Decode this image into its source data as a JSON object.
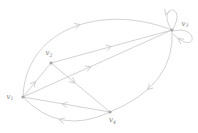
{
  "diagram": {
    "type": "directed-graph",
    "canvas": {
      "width": 198,
      "height": 133,
      "background": "#ffffff"
    },
    "style": {
      "edge_color": "#c7c7c7",
      "node_color": "#a6a6a6",
      "label_color": "#7a7a7a",
      "edge_width": 0.8,
      "node_radius": 1.6,
      "label_font_size": 7,
      "subscript_font_size": 4.6
    },
    "nodes": [
      {
        "id": "v1",
        "label": "v",
        "sub": "1",
        "x": 23,
        "y": 97,
        "label_x": 6.5,
        "label_y": 98.5
      },
      {
        "id": "v2",
        "label": "v",
        "sub": "2",
        "x": 51,
        "y": 63,
        "label_x": 45.5,
        "label_y": 55
      },
      {
        "id": "v3",
        "label": "v",
        "sub": "3",
        "x": 172,
        "y": 30,
        "label_x": 181.5,
        "label_y": 25.5
      },
      {
        "id": "v4",
        "label": "v",
        "sub": "4",
        "x": 110,
        "y": 112,
        "label_x": 109,
        "label_y": 122
      }
    ],
    "edges": [
      {
        "id": "e1",
        "from": "v1",
        "to": "v2",
        "shape": "line",
        "path": "M 23 97 L 51 63",
        "arrow": {
          "x": 35.5,
          "y": 81.5,
          "a": -50.5
        }
      },
      {
        "id": "e2",
        "from": "v1",
        "to": "v3",
        "shape": "line",
        "path": "M 23 97 L 172 30",
        "arrow": {
          "x": 91,
          "y": 66.5,
          "a": -24.2
        }
      },
      {
        "id": "e3",
        "from": "v1",
        "to": "v3",
        "shape": "top-arc",
        "path": "M 23 97 C 25 30 100 2 172 30",
        "arrow": {
          "x": 80,
          "y": 24.5,
          "a": -17.7
        }
      },
      {
        "id": "e4",
        "from": "v2",
        "to": "v3",
        "shape": "line",
        "path": "M 51 63 L 172 30",
        "arrow": {
          "x": 111.5,
          "y": 46.5,
          "a": -15.3
        }
      },
      {
        "id": "e5",
        "from": "v2",
        "to": "v4",
        "shape": "line",
        "path": "M 51 63 L 110 112",
        "arrow": {
          "x": 75,
          "y": 83,
          "a": 39.7
        }
      },
      {
        "id": "e6",
        "from": "v3",
        "to": "v4",
        "shape": "right-arc",
        "path": "M 172 30 Q 176 85 110 112",
        "arrow": {
          "x": 147.5,
          "y": 89.5,
          "a": 138
        }
      },
      {
        "id": "e7",
        "from": "v4",
        "to": "v1",
        "shape": "line",
        "path": "M 110 112 L 23 97",
        "arrow": {
          "x": 62,
          "y": 104,
          "a": 190.2
        }
      },
      {
        "id": "e8",
        "from": "v4",
        "to": "v1",
        "shape": "bottom-arc",
        "path": "M 110 112 Q 60 136 23 97",
        "arrow": {
          "x": 59,
          "y": 119.5,
          "a": 194
        }
      },
      {
        "id": "e9",
        "from": "v3",
        "to": "v3",
        "shape": "loop-top",
        "path": "M 171 29 C 156 4 188 3 173 29",
        "arrow": {
          "x": 165.5,
          "y": 15,
          "a": 112
        }
      },
      {
        "id": "e10",
        "from": "v3",
        "to": "v3",
        "shape": "loop-right",
        "path": "M 174 31 C 199 24 198 58 173 34",
        "arrow": {
          "x": 178,
          "y": 38.5,
          "a": 214
        }
      }
    ]
  }
}
